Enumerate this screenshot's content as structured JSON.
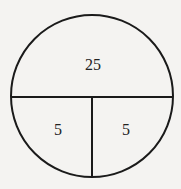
{
  "diagram": {
    "shape": "circle",
    "stroke_color": "#1a1a1a",
    "background_color": "#f4f3f1",
    "regions": [
      {
        "id": "top",
        "label": "25"
      },
      {
        "id": "bottom-left",
        "label": "5"
      },
      {
        "id": "bottom-right",
        "label": "5"
      }
    ]
  }
}
